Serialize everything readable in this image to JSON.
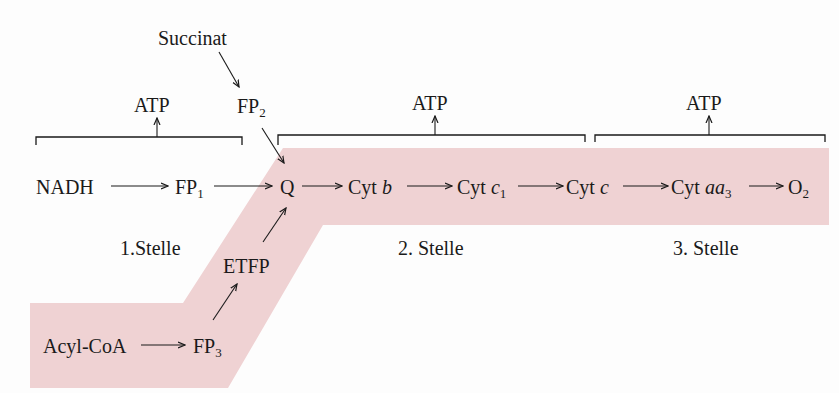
{
  "colors": {
    "band": "#efd2d3",
    "ink": "#1a1a1a",
    "background": "#fdfdfd"
  },
  "nodes": {
    "succinat": "Succinat",
    "fp2": "FP",
    "fp2_sub": "2",
    "nadh": "NADH",
    "fp1": "FP",
    "fp1_sub": "1",
    "q": "Q",
    "cyt_b": "Cyt ",
    "cyt_b_it": "b",
    "cyt_c1": "Cyt ",
    "cyt_c1_it": "c",
    "cyt_c1_sub": "1",
    "cyt_c": "Cyt ",
    "cyt_c_it": "c",
    "cyt_aa3": "Cyt ",
    "cyt_aa3_it": "aa",
    "cyt_aa3_sub": "3",
    "o2": "O",
    "o2_sub": "2",
    "etfp": "ETFP",
    "acyl_coa": "Acyl-CoA",
    "fp3": "FP",
    "fp3_sub": "3"
  },
  "atp_labels": [
    "ATP",
    "ATP",
    "ATP"
  ],
  "sites": [
    "1.Stelle",
    "2. Stelle",
    "3. Stelle"
  ]
}
